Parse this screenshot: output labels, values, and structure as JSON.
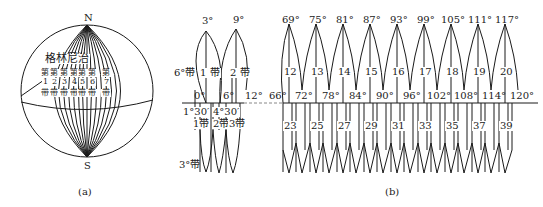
{
  "figure_a": {
    "caption": "(a)",
    "north_label": "N",
    "south_label": "S",
    "greenwich_label": "格林尼治",
    "zones": [
      {
        "prefix": "第",
        "number": "1",
        "suffix": "带"
      },
      {
        "prefix": "第",
        "number": "2",
        "suffix": "带"
      },
      {
        "prefix": "第",
        "number": "3",
        "suffix": "带"
      },
      {
        "prefix": "第",
        "number": "4",
        "suffix": "带"
      },
      {
        "prefix": "第",
        "number": "5",
        "suffix": "带"
      },
      {
        "prefix": "第",
        "number": "6",
        "suffix": "带"
      },
      {
        "prefix": "第",
        "number": "7",
        "suffix": "带"
      }
    ]
  },
  "figure_b": {
    "caption": "(b)",
    "six_degree_label": "6°带",
    "three_degree_label": "3°带",
    "left_section": {
      "top_meridians": [
        "3°",
        "9°"
      ],
      "six_zones": [
        "1 带",
        "2 带"
      ],
      "equator_labels": [
        "0°",
        "6°",
        "12°"
      ],
      "three_deg_meridians": [
        "1°30′",
        "4°30′"
      ],
      "three_zones": [
        "1带",
        "2带",
        "3带"
      ]
    },
    "right_section": {
      "central_meridians": [
        "69°",
        "75°",
        "81°",
        "87°",
        "93°",
        "99°",
        "105°",
        "111°",
        "117°"
      ],
      "six_zone_numbers": [
        "12",
        "13",
        "14",
        "15",
        "16",
        "17",
        "18",
        "19",
        "20"
      ],
      "boundary_labels": [
        "66°",
        "72°",
        "78°",
        "84°",
        "90°",
        "96°",
        "102°",
        "108°",
        "114°",
        "120°"
      ],
      "three_zone_numbers": [
        "23",
        "25",
        "27",
        "29",
        "31",
        "33",
        "35",
        "37",
        "39"
      ]
    }
  }
}
